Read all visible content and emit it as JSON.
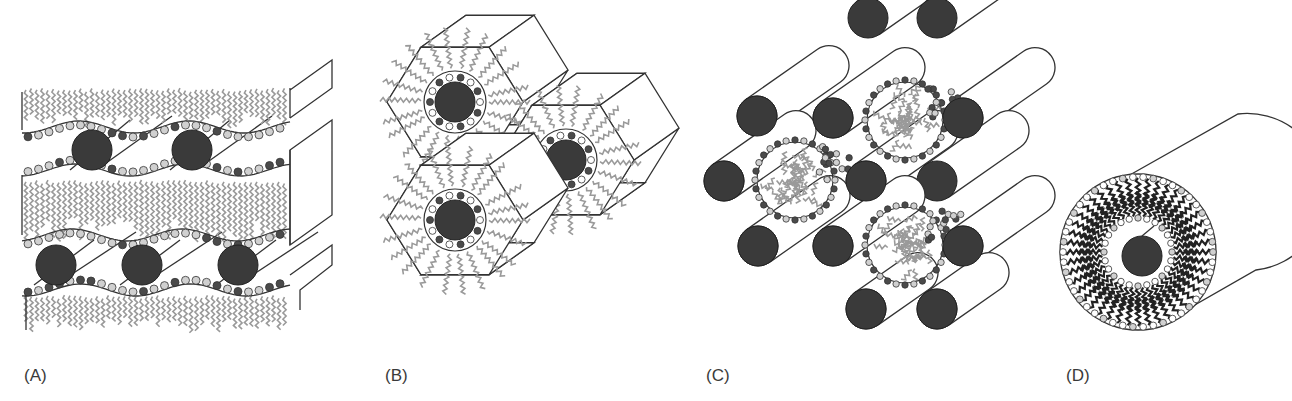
{
  "figure": {
    "panels": [
      {
        "id": "A",
        "label": "(A)",
        "description": "Lamellar phase: layers of surfactant bilayers with hydrophobic tails separating water channels containing rod-like inclusions"
      },
      {
        "id": "B",
        "label": "(B)",
        "description": "Inverse hexagonal phase: hexagonal prisms with a dark core surrounded by a ring of headgroups and radiating tails"
      },
      {
        "id": "C",
        "label": "(C)",
        "description": "Close-packed cylinders with spherical micelles in the interstitial spaces"
      },
      {
        "id": "D",
        "label": "(D)",
        "description": "Single cylinder cross-section: dark core, water layer, and a thick shell of surfactant molecules"
      }
    ]
  },
  "colors": {
    "core": "#3a3a3a",
    "head_dark": "#4a4a4a",
    "head_light": "#d0d0d0",
    "tail_gray": "#9a9a9a",
    "outline": "#333333",
    "label_text": "#3a3a3a"
  }
}
